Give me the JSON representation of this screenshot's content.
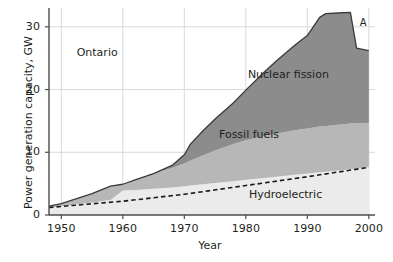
{
  "chart_data": {
    "type": "area",
    "subtype": "stacked-area",
    "title": "",
    "xlabel": "Year",
    "ylabel": "Power generation capacity, GW",
    "region_label": "Ontario",
    "xlim": [
      1948,
      2001
    ],
    "ylim": [
      0,
      33
    ],
    "xticks": [
      1950,
      1960,
      1970,
      1980,
      1990,
      2000
    ],
    "yticks": [
      0,
      10,
      20,
      30
    ],
    "grid": true,
    "grid_color": "#d9d9d9",
    "legend": "inline-labels",
    "x": [
      1948,
      1950,
      1955,
      1958,
      1960,
      1962,
      1965,
      1968,
      1970,
      1971,
      1973,
      1975,
      1978,
      1980,
      1983,
      1985,
      1988,
      1990,
      1992,
      1993,
      1995,
      1997,
      1998,
      2000
    ],
    "series": [
      {
        "name": "Hydroelectric",
        "color": "#ebebeb",
        "values": [
          1.2,
          1.4,
          2.0,
          2.4,
          3.9,
          4.0,
          4.2,
          4.4,
          4.6,
          4.7,
          4.9,
          5.1,
          5.4,
          5.6,
          5.9,
          6.1,
          6.4,
          6.6,
          6.8,
          6.9,
          7.1,
          7.3,
          7.4,
          7.6
        ]
      },
      {
        "name": "Fossil fuels",
        "color": "#b7b7b7",
        "values": [
          0.2,
          0.4,
          1.4,
          2.2,
          1.0,
          1.6,
          2.4,
          3.1,
          3.6,
          4.0,
          4.6,
          5.2,
          5.9,
          6.3,
          6.7,
          6.9,
          7.1,
          7.2,
          7.3,
          7.3,
          7.3,
          7.3,
          7.2,
          7.1
        ]
      },
      {
        "name": "Nuclear fission",
        "color": "#8c8c8c",
        "values": [
          0.0,
          0.0,
          0.0,
          0.0,
          0.0,
          0.0,
          0.0,
          0.4,
          1.4,
          2.6,
          3.9,
          5.0,
          6.6,
          8.0,
          10.2,
          11.6,
          13.6,
          14.8,
          17.4,
          17.9,
          17.8,
          17.7,
          12.0,
          11.5
        ]
      }
    ],
    "dashed_line": {
      "name": "hydroelectric-trend",
      "style": "dashed",
      "color": "#1a1a1a",
      "x": [
        1948,
        1960,
        1970,
        1980,
        1990,
        2000
      ],
      "y": [
        1.2,
        2.2,
        3.3,
        4.7,
        6.1,
        7.6
      ]
    },
    "annotations": [
      {
        "text": "A",
        "x": 1999,
        "y": 30.5
      }
    ],
    "series_labels": [
      {
        "text": "Nuclear fission",
        "x": 1987,
        "y": 22.2
      },
      {
        "text": "Fossil fuels",
        "x": 1981,
        "y": 12.6
      },
      {
        "text": "Hydroelectric",
        "x": 1987,
        "y": 3.1
      }
    ]
  },
  "axes": {
    "ylabel": "Power generation capacity, GW",
    "xlabel": "Year",
    "yticks": [
      "0",
      "10",
      "20",
      "30"
    ],
    "xticks": [
      "1950",
      "1960",
      "1970",
      "1980",
      "1990",
      "2000"
    ]
  },
  "labels": {
    "region": "Ontario",
    "nuclear": "Nuclear fission",
    "fossil": "Fossil fuels",
    "hydro": "Hydroelectric",
    "annotation_a": "A"
  },
  "colors": {
    "hydroelectric": "#ebebeb",
    "fossil_fuels": "#b7b7b7",
    "nuclear_fission": "#8c8c8c",
    "outline": "#3a3a3a",
    "grid": "#d9d9d9",
    "axis": "#4d4d4d",
    "text": "#231f20",
    "background": "#ffffff"
  }
}
